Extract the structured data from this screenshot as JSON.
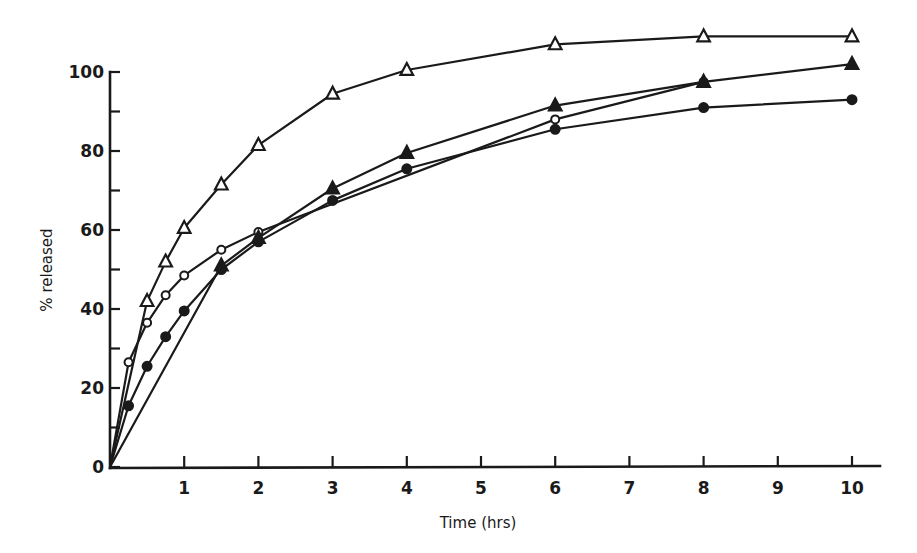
{
  "chart_data": {
    "type": "line",
    "title": "",
    "xlabel": "Time (hrs)",
    "ylabel": "% released",
    "xlim": [
      0,
      10.4
    ],
    "ylim": [
      0,
      110
    ],
    "xticks": [
      1,
      2,
      3,
      4,
      5,
      6,
      7,
      8,
      9,
      10
    ],
    "yticks_labeled": [
      0,
      20,
      40,
      60,
      80,
      100
    ],
    "yticks_minor": [
      10,
      30,
      50,
      70,
      90
    ],
    "grid": false,
    "legend": "none",
    "series": [
      {
        "name": "open-triangle",
        "marker": "open-triangle",
        "x": [
          0,
          0.5,
          0.75,
          1,
          1.5,
          2,
          3,
          4,
          6,
          8,
          10
        ],
        "values": [
          0,
          42,
          52,
          60.5,
          71.5,
          81.5,
          94.5,
          100.5,
          107,
          109,
          109
        ]
      },
      {
        "name": "open-circle",
        "marker": "open-circle",
        "x": [
          0,
          0.25,
          0.5,
          0.75,
          1,
          1.5,
          2,
          6,
          8
        ],
        "values": [
          0,
          26.5,
          36.5,
          43.5,
          48.5,
          55,
          59.5,
          88,
          97.5
        ]
      },
      {
        "name": "filled-triangle",
        "marker": "filled-triangle",
        "x": [
          0,
          1.5,
          2,
          3,
          4,
          6,
          8,
          10
        ],
        "values": [
          0,
          51,
          58,
          70.5,
          79.5,
          91.5,
          97.5,
          102
        ]
      },
      {
        "name": "filled-circle",
        "marker": "filled-circle",
        "x": [
          0,
          0.25,
          0.5,
          0.75,
          1,
          1.5,
          2,
          3,
          4,
          6,
          8,
          10
        ],
        "values": [
          0,
          15.5,
          25.5,
          33,
          39.5,
          50,
          57,
          67.5,
          75.5,
          85.5,
          91,
          93
        ]
      }
    ]
  },
  "axes": {
    "x_title": "Time (hrs)",
    "y_title": "% released",
    "x_tick_labels": [
      "1",
      "2",
      "3",
      "4",
      "5",
      "6",
      "7",
      "8",
      "9",
      "10"
    ],
    "y_tick_labels": [
      "0",
      "20",
      "40",
      "60",
      "80",
      "100"
    ]
  }
}
